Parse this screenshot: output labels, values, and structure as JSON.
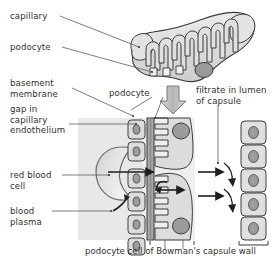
{
  "figure": {
    "title_caption": "podocyte cell of Bowman's capsule wall",
    "labels": {
      "capillary": "capillary",
      "podocyte_top": "podocyte",
      "basement_membrane": "basement\nmembrane",
      "gap_capillary_endothelium": "gap in\ncapillary\nendothelium",
      "red_blood_cell": "red blood\ncell",
      "blood_plasma": "blood\nplasma",
      "podocyte_mid": "podocyte",
      "filtrate": "filtrate in lumen\nof capsule"
    },
    "icons": {
      "flow_arrow": "down-block-arrow",
      "filtration_arrow": "right-arrow",
      "return_arrow": "curved-arrow"
    },
    "colors": {
      "ink": "#2f2f2f",
      "outline": "#3a3a3a",
      "plasma_fill": "#e6e6e6",
      "cell_fill": "#d9d9d9",
      "cell_fill_light": "#e9e9e9",
      "nucleus_fill": "#9e9e9e",
      "membrane_fill": "#b0b0b0",
      "arrow_fill": "#bdbdbd",
      "background": "#ffffff"
    },
    "counts": {
      "endothelial_cells": 6,
      "capsule_wall_cells": 5,
      "podocyte_loops_top": 7,
      "foot_process_slits": 8,
      "filtration_arrows": 3
    }
  }
}
